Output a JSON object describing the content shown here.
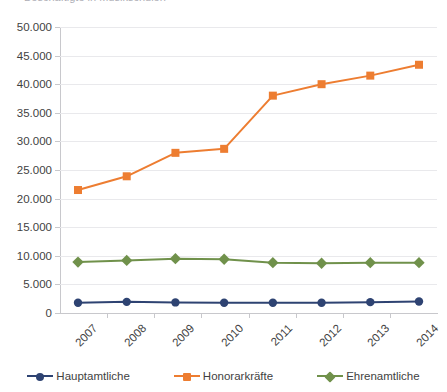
{
  "chart_data": {
    "type": "line",
    "title": "Beschäftigte in Musikschulen",
    "categories": [
      "2007",
      "2008",
      "2009",
      "2010",
      "2011",
      "2012",
      "2013",
      "2014"
    ],
    "xlabel": "",
    "ylabel": "",
    "ylim": [
      0,
      50000
    ],
    "ytick_step": 5000,
    "ytick_labels": [
      "0",
      "5.000",
      "10.000",
      "15.000",
      "20.000",
      "25.000",
      "30.000",
      "35.000",
      "40.000",
      "45.000",
      "50.000"
    ],
    "ytick_values": [
      0,
      5000,
      10000,
      15000,
      20000,
      25000,
      30000,
      35000,
      40000,
      45000,
      50000
    ],
    "grid": true,
    "legend_position": "bottom",
    "series": [
      {
        "name": "Hauptamtliche",
        "color": "#2e4372",
        "marker": "circle",
        "values": [
          1800,
          1950,
          1850,
          1800,
          1800,
          1800,
          1900,
          2000
        ]
      },
      {
        "name": "Honorarkräfte",
        "color": "#ed7d31",
        "marker": "square",
        "values": [
          21500,
          23900,
          28000,
          28700,
          38000,
          40000,
          41500,
          43400
        ]
      },
      {
        "name": "Ehrenamtliche",
        "color": "#70914b",
        "marker": "diamond",
        "values": [
          8900,
          9200,
          9500,
          9400,
          8800,
          8700,
          8800,
          8800
        ]
      }
    ]
  }
}
